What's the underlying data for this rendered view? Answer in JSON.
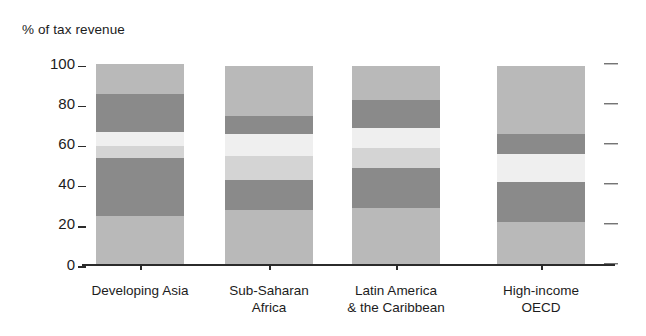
{
  "chart_data": {
    "type": "bar",
    "subtype": "stacked-bar",
    "title": "",
    "xlabel": "",
    "ylabel": "% of tax revenue",
    "ylim": [
      0,
      100
    ],
    "yticks": [
      0,
      20,
      40,
      60,
      80,
      100
    ],
    "ytick_labels": [
      "0",
      "20",
      "40",
      "60",
      "80",
      "100"
    ],
    "grid": false,
    "legend": "none",
    "stack_order": "bottom-to-top",
    "categories": [
      "Developing Asia",
      "Sub-Saharan Africa",
      "Latin America & the Caribbean",
      "High-income OECD"
    ],
    "series": [
      {
        "name": "segment-1",
        "color": "#b9b9b9",
        "values": [
          24,
          27,
          28,
          21
        ]
      },
      {
        "name": "segment-2",
        "color": "#8a8a8a",
        "values": [
          29,
          15,
          20,
          20
        ]
      },
      {
        "name": "segment-3",
        "color": "#d4d4d4",
        "values": [
          6,
          12,
          10,
          14
        ]
      },
      {
        "name": "segment-4",
        "color": "#efefef",
        "values": [
          7,
          11,
          10,
          10
        ]
      },
      {
        "name": "segment-5",
        "color": "#8a8a8a",
        "values": [
          19,
          9,
          14,
          0
        ]
      },
      {
        "name": "segment-6",
        "color": "#b9b9b9",
        "values": [
          15,
          25,
          17,
          34
        ]
      }
    ],
    "bars": [
      {
        "category": "Developing Asia",
        "label_lines": [
          "Developing Asia"
        ],
        "total": 100,
        "segments": [
          {
            "value": 24,
            "color": "#b9b9b9"
          },
          {
            "value": 29,
            "color": "#8a8a8a"
          },
          {
            "value": 6,
            "color": "#d4d4d4"
          },
          {
            "value": 7,
            "color": "#efefef"
          },
          {
            "value": 19,
            "color": "#8a8a8a"
          },
          {
            "value": 15,
            "color": "#b9b9b9"
          }
        ]
      },
      {
        "category": "Sub-Saharan Africa",
        "label_lines": [
          "Sub-Saharan",
          "Africa"
        ],
        "total": 99,
        "segments": [
          {
            "value": 27,
            "color": "#b9b9b9"
          },
          {
            "value": 15,
            "color": "#8a8a8a"
          },
          {
            "value": 12,
            "color": "#d4d4d4"
          },
          {
            "value": 11,
            "color": "#efefef"
          },
          {
            "value": 9,
            "color": "#8a8a8a"
          },
          {
            "value": 25,
            "color": "#b9b9b9"
          }
        ]
      },
      {
        "category": "Latin America & the Caribbean",
        "label_lines": [
          "Latin America",
          "& the Caribbean"
        ],
        "total": 99,
        "segments": [
          {
            "value": 28,
            "color": "#b9b9b9"
          },
          {
            "value": 20,
            "color": "#8a8a8a"
          },
          {
            "value": 10,
            "color": "#d4d4d4"
          },
          {
            "value": 10,
            "color": "#efefef"
          },
          {
            "value": 14,
            "color": "#8a8a8a"
          },
          {
            "value": 17,
            "color": "#b9b9b9"
          }
        ]
      },
      {
        "category": "High-income OECD",
        "label_lines": [
          "High-income",
          "OECD"
        ],
        "total": 99,
        "segments": [
          {
            "value": 21,
            "color": "#b9b9b9"
          },
          {
            "value": 20,
            "color": "#8a8a8a"
          },
          {
            "value": 14,
            "color": "#efefef"
          },
          {
            "value": 10,
            "color": "#8a8a8a"
          },
          {
            "value": 34,
            "color": "#b9b9b9"
          }
        ]
      }
    ]
  },
  "axis": {
    "y_title": "% of tax revenue",
    "ticks": [
      {
        "label": "100",
        "value": 100
      },
      {
        "label": "80",
        "value": 80
      },
      {
        "label": "60",
        "value": 60
      },
      {
        "label": "40",
        "value": 40
      },
      {
        "label": "20",
        "value": 20
      },
      {
        "label": "0",
        "value": 0
      }
    ]
  },
  "xlabels": [
    "Developing Asia",
    "Sub-Saharan\nAfrica",
    "Latin America\n& the Caribbean",
    "High-income\nOECD"
  ],
  "colors": {
    "ink": "#1c1c1c",
    "axis": "#2b2b2b",
    "light_grey": "#b9b9b9",
    "mid_grey": "#8a8a8a",
    "pale_grey": "#d4d4d4",
    "near_white": "#efefef"
  }
}
